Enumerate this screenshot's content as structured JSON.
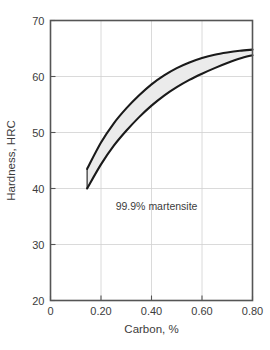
{
  "chart_data": {
    "type": "area",
    "title": "",
    "xlabel": "Carbon, %",
    "ylabel": "Hardness, HRC",
    "xlim": [
      0,
      0.8
    ],
    "ylim": [
      20,
      70
    ],
    "grid": true,
    "legend_position": "none",
    "xticks": [
      0,
      0.2,
      0.4,
      0.6,
      0.8
    ],
    "xtick_labels": [
      "0",
      "0.20",
      "0.40",
      "0.60",
      "0.80"
    ],
    "yticks": [
      20,
      30,
      40,
      50,
      60,
      70
    ],
    "ytick_labels": [
      "20",
      "30",
      "40",
      "50",
      "60",
      "70"
    ],
    "annotations": [
      {
        "text": "99.9% martensite",
        "x": 0.42,
        "y": 36.2
      }
    ],
    "band": {
      "name": "Hardness range of 99.9% martensite",
      "fill_color": "#ebebeb",
      "line_color": "#1a1a1a",
      "x": [
        0.145,
        0.2,
        0.25,
        0.3,
        0.35,
        0.4,
        0.45,
        0.5,
        0.55,
        0.6,
        0.65,
        0.7,
        0.75,
        0.8
      ],
      "upper": [
        43.5,
        48.2,
        51.6,
        54.3,
        56.6,
        58.6,
        60.2,
        61.5,
        62.5,
        63.3,
        63.9,
        64.3,
        64.6,
        64.8
      ],
      "lower": [
        40.0,
        44.3,
        47.6,
        50.3,
        52.7,
        54.8,
        56.6,
        58.1,
        59.4,
        60.5,
        61.5,
        62.4,
        63.2,
        63.8
      ]
    },
    "series": [
      {
        "name": "Upper bound",
        "x": [
          0.145,
          0.2,
          0.25,
          0.3,
          0.35,
          0.4,
          0.45,
          0.5,
          0.55,
          0.6,
          0.65,
          0.7,
          0.75,
          0.8
        ],
        "values": [
          43.5,
          48.2,
          51.6,
          54.3,
          56.6,
          58.6,
          60.2,
          61.5,
          62.5,
          63.3,
          63.9,
          64.3,
          64.6,
          64.8
        ]
      },
      {
        "name": "Lower bound",
        "x": [
          0.145,
          0.2,
          0.25,
          0.3,
          0.35,
          0.4,
          0.45,
          0.5,
          0.55,
          0.6,
          0.65,
          0.7,
          0.75,
          0.8
        ],
        "values": [
          40.0,
          44.3,
          47.6,
          50.3,
          52.7,
          54.8,
          56.6,
          58.1,
          59.4,
          60.5,
          61.5,
          62.4,
          63.2,
          63.8
        ]
      }
    ],
    "colors": {
      "frame": "#555555",
      "grid": "#d0d0d0",
      "band_fill": "#ebebeb",
      "band_line": "#1a1a1a",
      "text": "#3c3c3c",
      "background": "#ffffff"
    }
  }
}
